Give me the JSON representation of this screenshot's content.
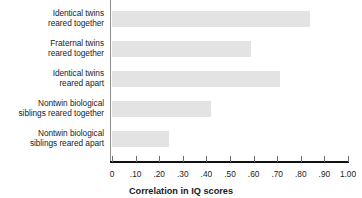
{
  "chart_data": {
    "type": "bar",
    "orientation": "horizontal",
    "title": "",
    "xlabel": "Correlation in IQ scores",
    "ylabel": "",
    "xlim": [
      0,
      1.0
    ],
    "grid": false,
    "legend": null,
    "bar_color": "#e3e3e3",
    "axis_color": "#111111",
    "categories": [
      "Identical twins reared together",
      "Fraternal twins reared together",
      "Identical twins reared apart",
      "Nontwin biological siblings reared together",
      "Nontwin biological siblings reared apart"
    ],
    "category_lines": [
      [
        "Identical twins",
        "reared together"
      ],
      [
        "Fraternal twins",
        "reared together"
      ],
      [
        "Identical twins",
        "reared apart"
      ],
      [
        "Nontwin biological",
        "siblings reared together"
      ],
      [
        "Nontwin biological",
        "siblings reared apart"
      ]
    ],
    "values": [
      0.84,
      0.59,
      0.71,
      0.42,
      0.24
    ],
    "tick_values": [
      0,
      0.1,
      0.2,
      0.3,
      0.4,
      0.5,
      0.6,
      0.7,
      0.8,
      0.9,
      1.0
    ],
    "tick_labels": [
      "0",
      ".10",
      ".20",
      ".30",
      ".40",
      ".50",
      ".60",
      ".70",
      ".80",
      ".90",
      "1.00"
    ]
  }
}
